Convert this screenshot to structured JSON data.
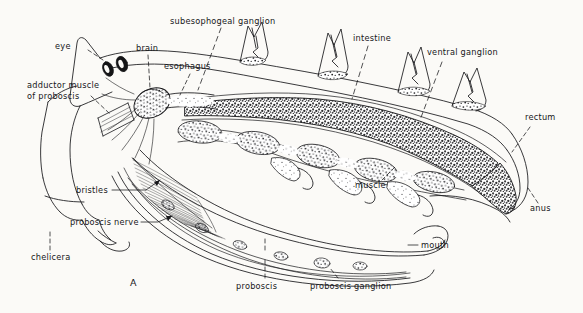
{
  "figure": {
    "panel_letter": "A",
    "background_color": "#fbfaf7",
    "ink_color": "#17171a"
  },
  "labels": [
    {
      "id": "eye",
      "text": "eye",
      "x": 68,
      "y": 46,
      "align": "left"
    },
    {
      "id": "brain",
      "text": "brain",
      "x": 137,
      "y": 48,
      "align": "left"
    },
    {
      "id": "adductor-muscle",
      "text": "adductor muscle\nof proboscis",
      "x": 31,
      "y": 84,
      "align": "left"
    },
    {
      "id": "esophagus",
      "text": "esophagus",
      "x": 171,
      "y": 66,
      "align": "left"
    },
    {
      "id": "subesophogeal-ganglion",
      "text": "subesophogeal ganglion",
      "x": 175,
      "y": 19,
      "align": "left"
    },
    {
      "id": "intestine",
      "text": "intestine",
      "x": 357,
      "y": 37,
      "align": "left"
    },
    {
      "id": "ventral-ganglion",
      "text": "ventral ganglion",
      "x": 430,
      "y": 52,
      "align": "left"
    },
    {
      "id": "rectum",
      "text": "rectum",
      "x": 524,
      "y": 117,
      "align": "left"
    },
    {
      "id": "anus",
      "text": "anus",
      "x": 529,
      "y": 208,
      "align": "left"
    },
    {
      "id": "muscle",
      "text": "muscle",
      "x": 357,
      "y": 183,
      "align": "left"
    },
    {
      "id": "mouth",
      "text": "mouth",
      "x": 423,
      "y": 242,
      "align": "left"
    },
    {
      "id": "bristles",
      "text": "bristles",
      "x": 78,
      "y": 185,
      "align": "left"
    },
    {
      "id": "proboscis-nerve",
      "text": "proboscis nerve",
      "x": 74,
      "y": 218,
      "align": "left"
    },
    {
      "id": "chelicera",
      "text": "chelicera",
      "x": 33,
      "y": 255,
      "align": "left"
    },
    {
      "id": "proboscis",
      "text": "proboscis",
      "x": 236,
      "y": 283,
      "align": "left"
    },
    {
      "id": "proboscis-ganglion",
      "text": "proboscis ganglion",
      "x": 313,
      "y": 283,
      "align": "left"
    }
  ]
}
